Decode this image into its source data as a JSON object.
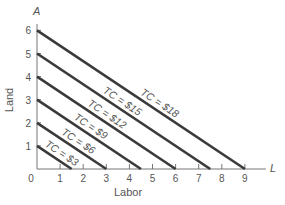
{
  "chart_data": {
    "type": "line",
    "title": "",
    "xlabel": "Labor",
    "ylabel": "Land",
    "x_axis_symbol": "L",
    "y_axis_symbol": "A",
    "xlim": [
      0,
      10
    ],
    "ylim": [
      0,
      6.7
    ],
    "x_ticks": [
      "0",
      "1",
      "2",
      "3",
      "4",
      "5",
      "6",
      "7",
      "8",
      "9"
    ],
    "y_ticks": [
      "1",
      "2",
      "3",
      "4",
      "5",
      "6"
    ],
    "grid": false,
    "legend": "none (lines labeled inline)",
    "series": [
      {
        "name": "TC = $3",
        "label": "TC = $3",
        "points": [
          [
            0,
            1
          ],
          [
            1.5,
            0
          ]
        ]
      },
      {
        "name": "TC = $6",
        "label": "TC = $6",
        "points": [
          [
            0,
            2
          ],
          [
            3,
            0
          ]
        ]
      },
      {
        "name": "TC = $9",
        "label": "TC = $9",
        "points": [
          [
            0,
            3
          ],
          [
            4.5,
            0
          ]
        ]
      },
      {
        "name": "TC = $12",
        "label": "TC = $12",
        "points": [
          [
            0,
            4
          ],
          [
            6,
            0
          ]
        ]
      },
      {
        "name": "TC = $15",
        "label": "TC = $15",
        "points": [
          [
            0,
            5
          ],
          [
            7.5,
            0
          ]
        ]
      },
      {
        "name": "TC = $18",
        "label": "TC = $18",
        "points": [
          [
            0,
            6
          ],
          [
            9,
            0
          ]
        ]
      }
    ],
    "line_color": "#3a3a3a",
    "axis_color": "#777777"
  }
}
